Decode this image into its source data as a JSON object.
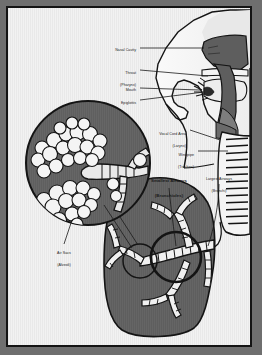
{
  "figure": {
    "frame_border_color": "#141414",
    "background_color": "#f2f2f2",
    "outer_background_color": "#6f6f6f",
    "tissue_dark_color": "#5e5e5e",
    "tissue_mid_color": "#8a8a8a",
    "airway_light_color": "#f4f4f4",
    "outline_color": "#141414"
  },
  "labels": [
    {
      "id": "nasal-cavity",
      "line1": "Nasal Cavity",
      "line2": "",
      "x": 128,
      "y": 40,
      "align": "right",
      "bold": false
    },
    {
      "id": "throat-pharynx",
      "line1": "Throat",
      "line2": "(Pharynx)",
      "x": 128,
      "y": 60,
      "align": "right",
      "bold": false
    },
    {
      "id": "mouth",
      "line1": "Mouth",
      "line2": "",
      "x": 128,
      "y": 79,
      "align": "right",
      "bold": false
    },
    {
      "id": "epiglottis",
      "line1": "Epiglottis",
      "line2": "",
      "x": 128,
      "y": 92,
      "align": "right",
      "bold": false
    },
    {
      "id": "vocal-cord-area",
      "line1": "Vocal Cord Area",
      "line2": "(Larynx)",
      "x": 178,
      "y": 120,
      "align": "right",
      "bold": false
    },
    {
      "id": "windpipe",
      "line1": "Windpipe",
      "line2": "(Trachea)",
      "x": 186,
      "y": 141,
      "align": "right",
      "bold": false
    },
    {
      "id": "largest-airways",
      "line1": "Largest Airways",
      "line2": "(Bronchi)",
      "x": 211,
      "y": 166,
      "align": "center",
      "bold": false
    },
    {
      "id": "smallest-airways",
      "line1": "Smallest Airways",
      "line2": "(Bronchioles)",
      "x": 161,
      "y": 168,
      "align": "center",
      "bold": true
    },
    {
      "id": "air-sacs",
      "line1": "Air Sacs",
      "line2": "(Alveoli)",
      "x": 56,
      "y": 240,
      "align": "center",
      "bold": false
    }
  ],
  "structures": {
    "head_profile": "sagittal head facing right",
    "nasal_cavity": "dark shaded cavity behind nose",
    "pharynx": "dark vertical airway column",
    "trachea": "ringed vertical tube at right edge",
    "lung": "large dark gray lung at lower right",
    "bronchial_tree": "branching ringed airways inside lung",
    "inset_circle": "magnified view of alveoli clusters",
    "alveoli": "grape-like white spheres on bronchiole"
  }
}
